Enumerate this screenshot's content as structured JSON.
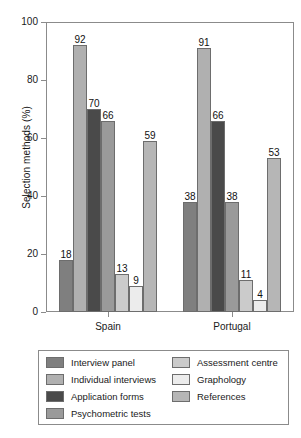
{
  "chart_data": {
    "type": "bar",
    "title": "",
    "subtitle": "",
    "xlabel": "",
    "ylabel": "Selection methods (%)",
    "ylim": [
      0,
      100
    ],
    "yticks": [
      0,
      20,
      40,
      60,
      80,
      100
    ],
    "ytick_labels": [
      "0",
      "20",
      "40",
      "60",
      "80",
      "100"
    ],
    "grid": false,
    "legend_position": "bottom",
    "data_labels": true,
    "categories": [
      "Spain",
      "Portugal"
    ],
    "series": [
      {
        "name": "Interview panel",
        "color": "#7f7f7f",
        "values": [
          18,
          38
        ]
      },
      {
        "name": "Individual interviews",
        "color": "#b0b0b0",
        "values": [
          92,
          91
        ]
      },
      {
        "name": "Application forms",
        "color": "#4a4a4a",
        "values": [
          70,
          66
        ]
      },
      {
        "name": "Psychometric tests",
        "color": "#9a9a9a",
        "values": [
          66,
          38
        ]
      },
      {
        "name": "Assessment centre",
        "color": "#cbcbcb",
        "values": [
          13,
          11
        ]
      },
      {
        "name": "Graphology",
        "color": "#ececec",
        "values": [
          9,
          4
        ]
      },
      {
        "name": "References",
        "color": "#b6b6b6",
        "values": [
          59,
          53
        ]
      }
    ]
  },
  "axis": {
    "y_title": "Selection methods (%)"
  },
  "legend": {
    "columns": [
      [
        "Interview panel",
        "Individual interviews",
        "Application forms",
        "Psychometric tests"
      ],
      [
        "Assessment centre",
        "Graphology",
        "References"
      ]
    ]
  },
  "colors": {
    "frame": "#8b8b8b",
    "bar_outline": "#6d6d6d",
    "text": "#1a1a1a",
    "background": "#ffffff"
  }
}
